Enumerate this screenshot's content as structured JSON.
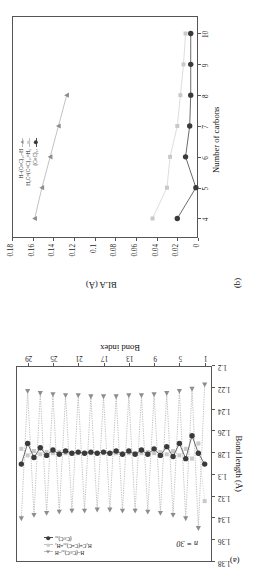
{
  "figure": {
    "panel_a_label": "(a)",
    "panel_b_label": "(b)"
  },
  "panel_a": {
    "annotation": "n = 30",
    "legend": [
      {
        "name": "H–(C≡C)₃₀–H",
        "marker": "triangle",
        "color": "#8d8d8d"
      },
      {
        "name": "H₂C=(C=C)₃₀=H₂",
        "marker": "square",
        "color": "#c9c9c9"
      },
      {
        "name": "(C≡C)₃₀",
        "marker": "circle",
        "color": "#3a3a3a"
      }
    ]
  },
  "panel_b": {
    "legend": [
      {
        "name": "H–(C≡C)₁₀–H",
        "marker": "triangle",
        "color": "#8d8d8d"
      },
      {
        "name": "H₂C=(C=C)₁₀=H₂",
        "marker": "square",
        "color": "#c9c9c9"
      },
      {
        "name": "(C≡C)₁₀",
        "marker": "circle",
        "color": "#3a3a3a"
      }
    ]
  },
  "chart_data": [
    {
      "type": "line",
      "panel": "(a)",
      "title": "",
      "xlabel": "Bond index",
      "ylabel": "Bond length (Å)",
      "xlim": [
        0,
        31
      ],
      "ylim": [
        1.2,
        1.38
      ],
      "xticks": [
        1,
        5,
        9,
        13,
        17,
        21,
        25,
        29
      ],
      "yticks": [
        1.2,
        1.22,
        1.24,
        1.26,
        1.28,
        1.3,
        1.32,
        1.34,
        1.36,
        1.38
      ],
      "ytick_labels": [
        "1.2",
        "1.22",
        "1.24",
        "1.26",
        "1.28",
        "1.3",
        "1.32",
        "1.34",
        "1.36",
        "1.38"
      ],
      "grid": false,
      "annotation": "n = 30",
      "legend_position": "top-left",
      "x": [
        1,
        2,
        3,
        4,
        5,
        6,
        7,
        8,
        9,
        10,
        11,
        12,
        13,
        14,
        15,
        16,
        17,
        18,
        19,
        20,
        21,
        22,
        23,
        24,
        25,
        26,
        27,
        28,
        29,
        30
      ],
      "series": [
        {
          "name": "H–(C≡C)₃₀–H",
          "marker": "triangle",
          "color": "#8d8d8d",
          "values": [
            1.218,
            1.35,
            1.222,
            1.341,
            1.224,
            1.338,
            1.226,
            1.336,
            1.227,
            1.335,
            1.228,
            1.334,
            1.228,
            1.334,
            1.229,
            1.333,
            1.229,
            1.333,
            1.229,
            1.334,
            1.228,
            1.334,
            1.228,
            1.335,
            1.227,
            1.336,
            1.226,
            1.338,
            1.224,
            1.341
          ]
        },
        {
          "name": "H₂C=(C=C)₃₀=H₂",
          "marker": "square",
          "color": "#c9c9c9",
          "values": [
            1.325,
            1.272,
            1.286,
            1.277,
            1.283,
            1.279,
            1.282,
            1.28,
            1.281,
            1.28,
            1.281,
            1.281,
            1.281,
            1.281,
            1.281,
            1.281,
            1.281,
            1.281,
            1.281,
            1.281,
            1.281,
            1.281,
            1.281,
            1.28,
            1.281,
            1.28,
            1.282,
            1.279,
            1.283,
            1.277
          ]
        },
        {
          "name": "(C≡C)₃₀",
          "marker": "circle",
          "color": "#3a3a3a",
          "values": [
            1.291,
            1.281,
            1.265,
            1.286,
            1.272,
            1.284,
            1.275,
            1.283,
            1.277,
            1.282,
            1.278,
            1.282,
            1.279,
            1.282,
            1.279,
            1.281,
            1.28,
            1.281,
            1.28,
            1.281,
            1.28,
            1.281,
            1.279,
            1.282,
            1.278,
            1.283,
            1.276,
            1.285,
            1.272,
            1.291
          ]
        }
      ]
    },
    {
      "type": "line",
      "panel": "(b)",
      "title": "",
      "xlabel": "Number of carbons",
      "ylabel": "BLA (Å)",
      "xlim": [
        3.4,
        10.6
      ],
      "ylim": [
        0,
        0.18
      ],
      "xticks": [
        4,
        5,
        6,
        7,
        8,
        9,
        10
      ],
      "yticks": [
        0,
        0.02,
        0.04,
        0.06,
        0.08,
        0.1,
        0.12,
        0.14,
        0.16,
        0.18
      ],
      "ytick_labels": [
        "0",
        "0.02",
        "0.04",
        "0.06",
        "0.08",
        "0.1",
        "0.12",
        "0.14",
        "0.16",
        "0.18"
      ],
      "grid": false,
      "legend_position": "top-right",
      "x": [
        4,
        5,
        6,
        7,
        8,
        9,
        10
      ],
      "series": [
        {
          "name": "H–(C≡C)₁₀–H",
          "marker": "triangle",
          "color": "#8d8d8d",
          "values": [
            0.159,
            0.152,
            0.144,
            0.136,
            0.128,
            null,
            null
          ]
        },
        {
          "name": "H₂C=(C=C)₁₀=H₂",
          "marker": "square",
          "color": "#c9c9c9",
          "values": [
            0.045,
            0.031,
            0.028,
            0.021,
            0.018,
            0.015,
            0.013
          ]
        },
        {
          "name": "(C≡C)₁₀",
          "marker": "circle",
          "color": "#3a3a3a",
          "values": [
            0.021,
            0.003,
            0.013,
            0.009,
            0.008,
            0.008,
            0.008
          ]
        }
      ]
    }
  ]
}
